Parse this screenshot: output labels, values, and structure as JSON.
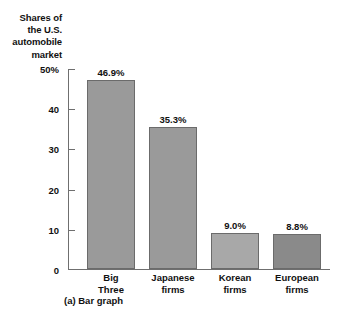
{
  "chart_data": {
    "type": "bar",
    "title": "Shares of the U.S. automobile market",
    "title_lines": [
      "Shares of",
      "the U.S.",
      "automobile",
      "market"
    ],
    "caption": "(a) Bar graph",
    "categories": [
      "Big Three",
      "Japanese firms",
      "Korean firms",
      "European firms"
    ],
    "category_lines": [
      [
        "Big",
        "Three"
      ],
      [
        "Japanese",
        "firms"
      ],
      [
        "Korean",
        "firms"
      ],
      [
        "European",
        "firms"
      ]
    ],
    "values": [
      46.9,
      35.3,
      9.0,
      8.8
    ],
    "value_labels": [
      "46.9%",
      "35.3%",
      "9.0%",
      "8.8%"
    ],
    "xlabel": "",
    "ylabel": "",
    "ylim": [
      0,
      50
    ],
    "ytick_labels": [
      "50%",
      "40",
      "30",
      "20",
      "10",
      "0"
    ],
    "ytick_values": [
      50,
      40,
      30,
      20,
      10,
      0
    ],
    "grid": false,
    "legend": "none",
    "bar_colors": [
      "#9a9a9a",
      "#9a9a9a",
      "#a8a8a8",
      "#8a8a8a"
    ],
    "bar_border_color": "#6b6b6b",
    "axis_color": "#6f6f6f",
    "text_color": "#111111",
    "background": "#ffffff"
  }
}
